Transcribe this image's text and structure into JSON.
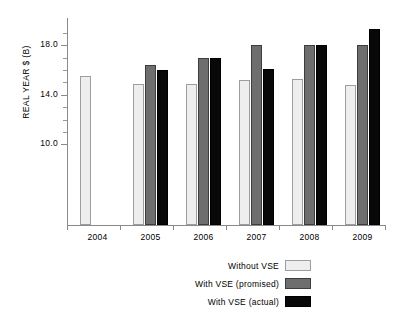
{
  "chart_data": {
    "type": "bar",
    "title": "",
    "subtitle": "",
    "xlabel": "",
    "ylabel": "REAL YEAR $ (B)",
    "categories": [
      "2004",
      "2005",
      "2006",
      "2007",
      "2008",
      "2009"
    ],
    "series": [
      {
        "name": "Without VSE",
        "color": "#eeeeee",
        "values": [
          15.5,
          14.9,
          14.9,
          15.2,
          15.3,
          14.8
        ]
      },
      {
        "name": "With VSE (promised)",
        "color": "#6e6e6e",
        "values": [
          null,
          16.4,
          17.0,
          18.0,
          18.0,
          18.0
        ]
      },
      {
        "name": "With VSE (actual)",
        "color": "#080808",
        "values": [
          null,
          16.0,
          17.0,
          16.1,
          18.0,
          19.3
        ]
      }
    ],
    "ylim": [
      3.5,
      20.2
    ],
    "ytick_labels": [
      "18.0",
      "14.0",
      "10.0"
    ],
    "ytick_values": [
      18.0,
      14.0,
      10.0
    ],
    "yminor_values": [
      19.0,
      17.0,
      16.0,
      15.0,
      13.0,
      12.0,
      11.0
    ],
    "grid": false,
    "legend_position": "bottom-center"
  },
  "legend": {
    "items": [
      {
        "label": "Without VSE"
      },
      {
        "label": "With VSE (promised)"
      },
      {
        "label": "With VSE (actual)"
      }
    ]
  }
}
